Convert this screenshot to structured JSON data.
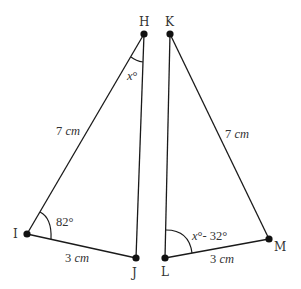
{
  "diagram": {
    "type": "geometry",
    "triangles": [
      {
        "name": "HIJ",
        "vertices": {
          "H": {
            "label": "H"
          },
          "I": {
            "label": "I"
          },
          "J": {
            "label": "J"
          }
        },
        "sides": {
          "HI": {
            "value": "7",
            "unit": "cm"
          },
          "IJ": {
            "value": "3",
            "unit": "cm"
          }
        },
        "angles": {
          "I": {
            "value": "82°"
          },
          "H": {
            "value": "x°"
          }
        }
      },
      {
        "name": "KLM",
        "vertices": {
          "K": {
            "label": "K"
          },
          "L": {
            "label": "L"
          },
          "M": {
            "label": "M"
          }
        },
        "sides": {
          "KM": {
            "value": "7",
            "unit": "cm"
          },
          "LM": {
            "value": "3",
            "unit": "cm"
          }
        },
        "angles": {
          "L": {
            "value": "x°- 32°"
          }
        }
      }
    ]
  },
  "labels": {
    "H": "H",
    "I": "I",
    "J": "J",
    "K": "K",
    "L": "L",
    "M": "M",
    "side_HI_num": "7 ",
    "side_HI_unit": "cm",
    "side_IJ_num": "3 ",
    "side_IJ_unit": "cm",
    "side_KM_num": "7 ",
    "side_KM_unit": "cm",
    "side_LM_num": "3 ",
    "side_LM_unit": "cm",
    "angle_I": "82°",
    "angle_H_var": "x",
    "angle_H_deg": "°",
    "angle_L_var": "x",
    "angle_L_rest": "°- 32°"
  }
}
